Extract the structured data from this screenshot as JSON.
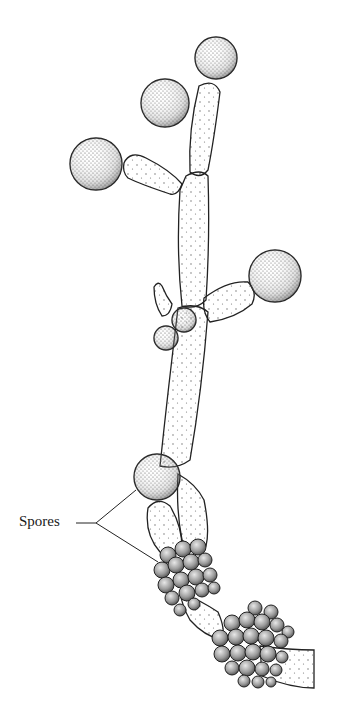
{
  "figure": {
    "labels": [
      {
        "id": "spores",
        "text": "Spores",
        "x": 19,
        "y": 513
      }
    ]
  },
  "style": {
    "stroke": "#222222",
    "background": "#ffffff",
    "stipple": "#555555"
  }
}
